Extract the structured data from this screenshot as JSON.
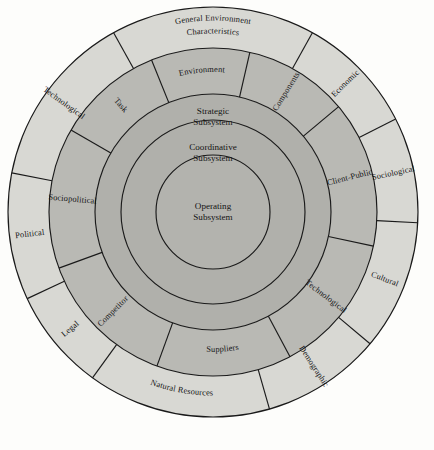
{
  "diagram": {
    "background_color": "#fdfdfb",
    "center": {
      "cx": 213,
      "cy": 212
    },
    "colors": {
      "outer_ring": "#d8d8d3",
      "middle_ring": "#b9b9b4",
      "inner_circles": "#b0b0ab",
      "stroke": "#1a1a1a",
      "text": "#141414"
    },
    "radii": {
      "outer_edge": 205,
      "outer_inner_edge": 164,
      "middle_outer_edge": 164,
      "middle_inner_edge": 118,
      "strategic": 118,
      "coordinative": 92,
      "operating": 57
    },
    "outer_ring": {
      "name": "General Environment Characteristics",
      "heading_segment": "General Environment Characteristics",
      "segments": [
        {
          "label": "General Environment Characteristics",
          "two_line": true,
          "line1": "General Environment",
          "line2": "Characteristics",
          "start_deg": -119,
          "end_deg": -61,
          "orientation": "horizontal"
        },
        {
          "label": "Economic",
          "start_deg": -61,
          "end_deg": -27,
          "orientation": "radial"
        },
        {
          "label": "Sociological",
          "start_deg": -27,
          "end_deg": 3,
          "orientation": "radial"
        },
        {
          "label": "Cultural",
          "start_deg": 3,
          "end_deg": 40,
          "orientation": "radial"
        },
        {
          "label": "Demographic",
          "start_deg": 40,
          "end_deg": 74,
          "orientation": "radial"
        },
        {
          "label": "Natural Resources",
          "start_deg": 74,
          "end_deg": 126,
          "orientation": "horizontal"
        },
        {
          "label": "Legal",
          "start_deg": 126,
          "end_deg": 155,
          "orientation": "radial"
        },
        {
          "label": "Political",
          "start_deg": 155,
          "end_deg": 191,
          "orientation": "radial"
        },
        {
          "label": "Technological",
          "start_deg": 191,
          "end_deg": 241,
          "orientation": "radial"
        }
      ]
    },
    "middle_ring": {
      "name": "Environment Components",
      "heading_left": "Environment",
      "heading_right": "Components",
      "segments": [
        {
          "label": "Environment",
          "start_deg": -112,
          "end_deg": -77,
          "orientation": "horizontal"
        },
        {
          "label": "Components",
          "start_deg": -77,
          "end_deg": -40,
          "orientation": "radial"
        },
        {
          "label": "Client-Public",
          "start_deg": -40,
          "end_deg": 12,
          "orientation": "radial"
        },
        {
          "label": "Technological",
          "start_deg": 12,
          "end_deg": 62,
          "orientation": "radial"
        },
        {
          "label": "Suppliers",
          "start_deg": 62,
          "end_deg": 110,
          "orientation": "horizontal"
        },
        {
          "label": "Competitor",
          "start_deg": 110,
          "end_deg": 160,
          "orientation": "radial"
        },
        {
          "label": "Sociopolitical",
          "start_deg": 160,
          "end_deg": 210,
          "orientation": "radial"
        },
        {
          "label": "Task",
          "start_deg": 210,
          "end_deg": 248,
          "orientation": "radial"
        }
      ]
    },
    "inner_circles": [
      {
        "id": "strategic",
        "line1": "Strategic",
        "line2": "Subsystem",
        "radius": 118,
        "label_y": 114
      },
      {
        "id": "coordinative",
        "line1": "Coordinative",
        "line2": "Subsystem",
        "radius": 92,
        "label_y": 150
      },
      {
        "id": "operating",
        "line1": "Operating",
        "line2": "Subsystem",
        "radius": 57,
        "label_y": 209
      }
    ]
  }
}
